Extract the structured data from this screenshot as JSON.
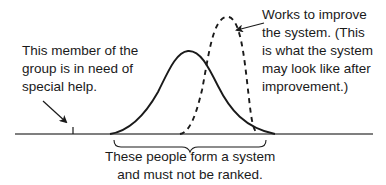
{
  "diagram": {
    "type": "distribution-comparison",
    "annotations": {
      "special_help": {
        "lines": [
          "This member of the",
          "group is in need of",
          "special help."
        ]
      },
      "improve_system": {
        "lines": [
          "Works to improve",
          "the system. (This",
          "is what the system",
          "may look like after",
          "improvement.)"
        ]
      },
      "system_group": {
        "lines": [
          "These people form a system",
          "and must not be ranked."
        ]
      }
    },
    "curves": [
      {
        "name": "current-system",
        "style": "solid",
        "color": "#1a1a1a"
      },
      {
        "name": "improved-system",
        "style": "dashed",
        "color": "#1a1a1a"
      }
    ],
    "colors": {
      "ink": "#1a1a1a",
      "background": "#ffffff"
    }
  }
}
